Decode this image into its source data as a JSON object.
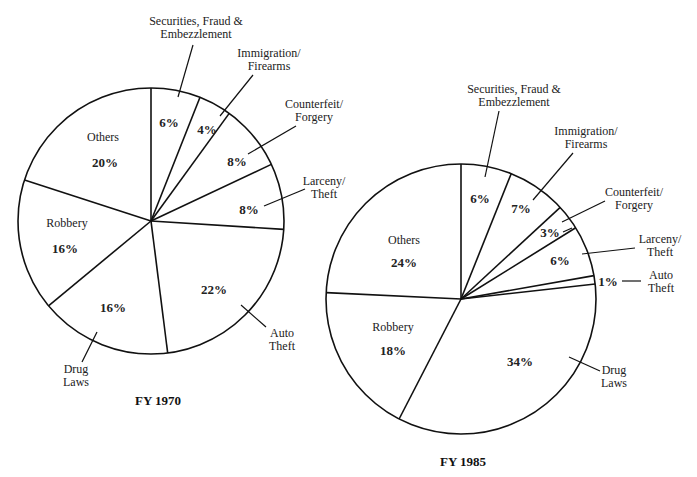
{
  "chart_data": [
    {
      "type": "pie",
      "title": "FY 1970",
      "start_angle_deg": 0,
      "direction": "clockwise",
      "slices": [
        {
          "label": "Securities, Fraud & Embezzlement",
          "value": 6
        },
        {
          "label": "Immigration/ Firearms",
          "value": 4
        },
        {
          "label": "Counterfeit/ Forgery",
          "value": 8
        },
        {
          "label": "Larceny/ Theft",
          "value": 8
        },
        {
          "label": "Auto Theft",
          "value": 22
        },
        {
          "label": "Drug Laws",
          "value": 16
        },
        {
          "label": "Robbery",
          "value": 16
        },
        {
          "label": "Others",
          "value": 20
        }
      ],
      "categories": [
        "Securities, Fraud & Embezzlement",
        "Immigration/Firearms",
        "Counterfeit/Forgery",
        "Larceny/Theft",
        "Auto Theft",
        "Drug Laws",
        "Robbery",
        "Others"
      ],
      "values": [
        6,
        4,
        8,
        8,
        22,
        16,
        16,
        20
      ],
      "unit": "%"
    },
    {
      "type": "pie",
      "title": "FY 1985",
      "start_angle_deg": 0,
      "direction": "clockwise",
      "slices": [
        {
          "label": "Securities, Fraud & Embezzlement",
          "value": 6
        },
        {
          "label": "Immigration/ Firearms",
          "value": 7
        },
        {
          "label": "Counterfeit/ Forgery",
          "value": 3
        },
        {
          "label": "Larceny/ Theft",
          "value": 6
        },
        {
          "label": "Auto Theft",
          "value": 1
        },
        {
          "label": "Drug Laws",
          "value": 34
        },
        {
          "label": "Robbery",
          "value": 18
        },
        {
          "label": "Others",
          "value": 24
        }
      ],
      "categories": [
        "Securities, Fraud & Embezzlement",
        "Immigration/Firearms",
        "Counterfeit/Forgery",
        "Larceny/Theft",
        "Auto Theft",
        "Drug Laws",
        "Robbery",
        "Others"
      ],
      "values": [
        6,
        7,
        3,
        6,
        1,
        34,
        18,
        24
      ],
      "unit": "%"
    }
  ],
  "pie1970": {
    "title": "FY 1970",
    "sec_l1": "Securities, Fraud &",
    "sec_l2": "Embezzlement",
    "sec_pct": "6%",
    "imm_l1": "Immigration/",
    "imm_l2": "Firearms",
    "imm_pct": "4%",
    "cf_l1": "Counterfeit/",
    "cf_l2": "Forgery",
    "cf_pct": "8%",
    "lar_l1": "Larceny/",
    "lar_l2": "Theft",
    "lar_pct": "8%",
    "auto_l1": "Auto",
    "auto_l2": "Theft",
    "auto_pct": "22%",
    "drug_l1": "Drug",
    "drug_l2": "Laws",
    "drug_pct": "16%",
    "rob_label": "Robbery",
    "rob_pct": "16%",
    "oth_label": "Others",
    "oth_pct": "20%"
  },
  "pie1985": {
    "title": "FY 1985",
    "sec_l1": "Securities, Fraud &",
    "sec_l2": "Embezzlement",
    "sec_pct": "6%",
    "imm_l1": "Immigration/",
    "imm_l2": "Firearms",
    "imm_pct": "7%",
    "cf_l1": "Counterfeit/",
    "cf_l2": "Forgery",
    "cf_pct": "3%",
    "lar_l1": "Larceny/",
    "lar_l2": "Theft",
    "lar_pct": "6%",
    "auto_l1": "Auto",
    "auto_l2": "Theft",
    "auto_pct": "1%",
    "drug_l1": "Drug",
    "drug_l2": "Laws",
    "drug_pct": "34%",
    "rob_label": "Robbery",
    "rob_pct": "18%",
    "oth_label": "Others",
    "oth_pct": "24%"
  }
}
